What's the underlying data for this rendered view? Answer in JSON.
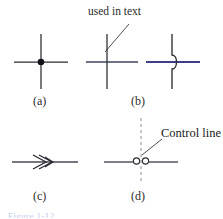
{
  "figure": {
    "background_color": "#ffffff",
    "annotations": {
      "used_in_text": "used in text",
      "control_line": "Control line"
    },
    "sublabels": {
      "a": "(a)",
      "b": "(b)",
      "c": "(c)",
      "d": "(d)"
    },
    "caption_partial": "Figure 1-12",
    "colors": {
      "wire_dark": "#2b2b33",
      "wire_blue": "#3c3f86",
      "wire_gray_blue": "#6f7487",
      "dot_fill": "#111118",
      "leader": "#3a3a46",
      "dashed": "#8c8c96",
      "text": "#1a1a1a"
    },
    "panels": [
      {
        "id": "a",
        "name": "connected-junction",
        "description": "Crossing wires with solid dot indicating electrical connection",
        "label": "(a)"
      },
      {
        "id": "b",
        "name": "crossing-no-connection",
        "description": "Two conventions for wires crossing without connection: plain cross (used in text) and hop/jog loop",
        "label": "(b)"
      },
      {
        "id": "c",
        "name": "line-with-arrowheads",
        "description": "Horizontal line with double arrowhead marker",
        "label": "(c)"
      },
      {
        "id": "d",
        "name": "switch-contact-with-control-line",
        "description": "Horizontal line with two open contact circles and a dashed vertical control line",
        "label": "(d)"
      }
    ]
  }
}
